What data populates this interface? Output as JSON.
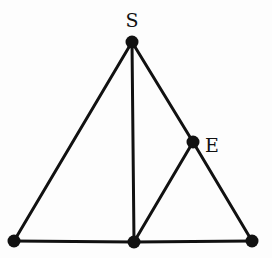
{
  "diagram": {
    "type": "graph",
    "stroke_color": "#111111",
    "node_color": "#111111",
    "nodes": [
      {
        "id": "S",
        "label": "S",
        "x": 132,
        "y": 42,
        "label_x": 132,
        "label_y": 27,
        "label_anchor": "middle"
      },
      {
        "id": "E",
        "label": "E",
        "x": 193,
        "y": 142,
        "label_x": 205,
        "label_y": 152,
        "label_anchor": "start"
      },
      {
        "id": "BL",
        "label": "",
        "x": 14,
        "y": 241
      },
      {
        "id": "BM",
        "label": "",
        "x": 134,
        "y": 242
      },
      {
        "id": "BR",
        "label": "",
        "x": 252,
        "y": 241
      }
    ],
    "edges": [
      [
        "S",
        "BL"
      ],
      [
        "S",
        "BM"
      ],
      [
        "S",
        "E"
      ],
      [
        "E",
        "BR"
      ],
      [
        "E",
        "BM"
      ],
      [
        "BL",
        "BM"
      ],
      [
        "BM",
        "BR"
      ]
    ]
  }
}
